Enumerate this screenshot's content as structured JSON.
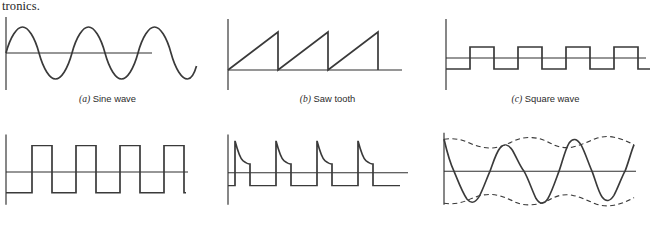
{
  "page": {
    "running_text": "tronics.",
    "background_color": "#ffffff",
    "ink_color": "#3a3a3a"
  },
  "figure": {
    "panels": [
      {
        "id": "sine-wave",
        "label": "(a)",
        "title": "Sine wave",
        "caption": "(a)  Sine wave",
        "has_caption": true,
        "waveform": "sine",
        "cycles": 3,
        "amplitude": 26,
        "baseline_y": 40,
        "axis_x": 6,
        "trace_start_x": 6,
        "trace_end_x": 168
      },
      {
        "id": "saw-tooth",
        "label": "(b)",
        "title": "Saw tooth",
        "caption": "(b)  Saw tooth",
        "has_caption": true,
        "waveform": "sawtooth",
        "cycles": 3,
        "amplitude": 31,
        "baseline_y": 57,
        "axis_x": 8,
        "trace_start_x": 8,
        "trace_end_x": 190
      },
      {
        "id": "square-wave",
        "label": "(c)",
        "title": "Square wave",
        "caption": "(c)  Square wave",
        "has_caption": true,
        "waveform": "square",
        "cycles": 4,
        "amplitude": 11,
        "duty_cycle_percent": 50,
        "baseline_y": 45,
        "axis_x": 8,
        "trace_start_x": 8,
        "trace_end_x": 205
      },
      {
        "id": "pulse-train",
        "label": "",
        "title": "",
        "caption": "",
        "has_caption": false,
        "waveform": "pulse-train",
        "cycles": 5,
        "high_level": 33,
        "low_level": -26,
        "duty_cycle_percent": 32,
        "baseline_y": 55,
        "axis_x": 6,
        "trace_start_x": 6,
        "trace_end_x": 188
      },
      {
        "id": "decaying-pulse-train",
        "label": "",
        "title": "",
        "caption": "",
        "has_caption": false,
        "waveform": "pulse-with-exponential-droop",
        "cycles": 4,
        "high_level": 40,
        "low_level": -16,
        "droop_level": 16,
        "baseline_y": 56,
        "axis_x": 8,
        "trace_start_x": 8,
        "trace_end_x": 190
      },
      {
        "id": "modulated-wave",
        "label": "",
        "title": "",
        "caption": "",
        "has_caption": false,
        "waveform": "amplitude-modulated",
        "carrier_cycles": 5,
        "modulation_cycles": 2,
        "carrier_amplitude": 40,
        "modulation_depth": 0.2,
        "baseline_y": 54,
        "axis_x": 6,
        "trace_start_x": 6,
        "trace_end_x": 198,
        "envelope_style": "dashed"
      }
    ]
  }
}
